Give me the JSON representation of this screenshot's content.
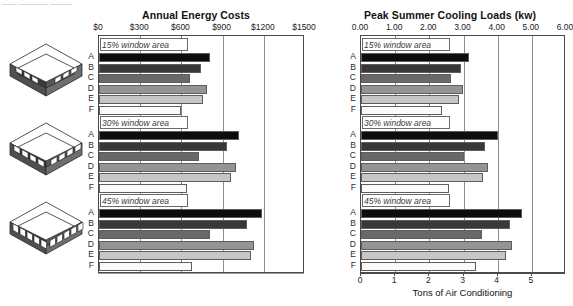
{
  "caption_strip": "—— ———— ———",
  "figure": {
    "row_labels": [
      "A",
      "B",
      "C",
      "D",
      "E",
      "F"
    ],
    "group_labels": [
      "15% window area",
      "30% window area",
      "45% window area"
    ],
    "bar_colors": [
      "#0d0d0d",
      "#383838",
      "#686868",
      "#949494",
      "#c6c6c6",
      "#fbfbfb"
    ],
    "building_label": "isometric-building-model"
  },
  "chart_data": [
    {
      "type": "bar",
      "orientation": "horizontal",
      "title": "Annual Energy Costs",
      "xlabel": "",
      "ylabel": "",
      "xlim": [
        0,
        1500
      ],
      "tick_values": [
        0,
        300,
        600,
        900,
        1200,
        1500
      ],
      "tick_labels": [
        "$0",
        "$300",
        "$600",
        "$900",
        "$1200",
        "$1500"
      ],
      "grid": true,
      "legend": "none",
      "categories": [
        "A",
        "B",
        "C",
        "D",
        "E",
        "F"
      ],
      "groups": [
        {
          "name": "15% window area",
          "values": [
            810,
            745,
            660,
            790,
            760,
            600
          ]
        },
        {
          "name": "30% window area",
          "values": [
            1020,
            935,
            725,
            1000,
            960,
            640
          ]
        },
        {
          "name": "45% window area",
          "values": [
            1185,
            1080,
            810,
            1125,
            1110,
            680
          ]
        }
      ]
    },
    {
      "type": "bar",
      "orientation": "horizontal",
      "title": "Peak Summer Cooling Loads (kw)",
      "xlabel": "Tons of Air Conditioning",
      "ylabel": "",
      "xlim": [
        0,
        6
      ],
      "tick_values": [
        0,
        1,
        2,
        3,
        4,
        5,
        6
      ],
      "tick_labels": [
        "0.00",
        "1.00",
        "2.00",
        "3.00",
        "4.00",
        "5.00",
        "6.00"
      ],
      "secondary_axis": {
        "label": "Tons of Air Conditioning",
        "tick_values": [
          0,
          1,
          2,
          3,
          4,
          5
        ],
        "tick_labels": [
          "0",
          "1",
          "2",
          "3",
          "4",
          "5"
        ],
        "max": 5.1
      },
      "grid": true,
      "legend": "none",
      "categories": [
        "A",
        "B",
        "C",
        "D",
        "E",
        "F"
      ],
      "groups": [
        {
          "name": "15% window area",
          "values": [
            3.15,
            2.92,
            2.62,
            2.98,
            2.88,
            2.38
          ]
        },
        {
          "name": "30% window area",
          "values": [
            4.02,
            3.62,
            3.02,
            3.72,
            3.58,
            2.58
          ]
        },
        {
          "name": "45% window area",
          "values": [
            4.72,
            4.35,
            3.55,
            4.42,
            4.25,
            3.38
          ]
        }
      ]
    }
  ]
}
